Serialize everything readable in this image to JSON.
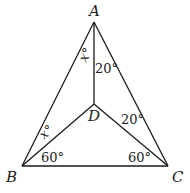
{
  "diagram": {
    "type": "geometry",
    "points": {
      "A": {
        "label": "A",
        "x": 94,
        "y": 22
      },
      "B": {
        "label": "B",
        "x": 22,
        "y": 166
      },
      "C": {
        "label": "C",
        "x": 168,
        "y": 166
      },
      "D": {
        "label": "D",
        "x": 94,
        "y": 104
      }
    },
    "segments": [
      "AB",
      "AC",
      "BC",
      "AD",
      "BD",
      "CD"
    ],
    "angles": {
      "BAD": "x°",
      "DAC": "20°",
      "ABD": "x°",
      "DBC": "60°",
      "ACD": "20°",
      "DCB": "60°"
    },
    "labels": {
      "A": "A",
      "B": "B",
      "C": "C",
      "D": "D",
      "angle_BAD": "x°",
      "angle_DAC": "20°",
      "angle_ABD": "x°",
      "angle_DBC": "60°",
      "angle_ACD": "20°",
      "angle_DCB": "60°"
    },
    "colors": {
      "line": "#1a1a1a",
      "text": "#222222",
      "background": "#ffffff"
    }
  }
}
